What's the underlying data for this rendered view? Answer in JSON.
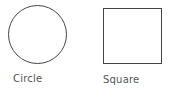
{
  "shapes": [
    {
      "type": "circle",
      "label": "Circle"
    },
    {
      "type": "square",
      "label": "Square"
    }
  ],
  "colors": {
    "stroke": "#444444",
    "label": "#555555",
    "background": "#ffffff"
  }
}
